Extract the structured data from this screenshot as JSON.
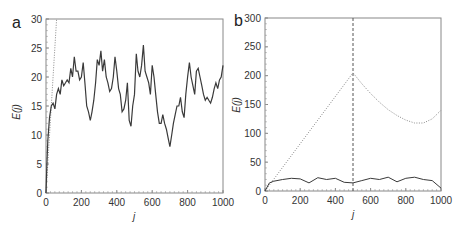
{
  "chart_data": [
    {
      "panel": "a",
      "type": "line",
      "xlabel": "j",
      "ylabel": "E(j)",
      "xlim": [
        0,
        1000
      ],
      "ylim": [
        0,
        30
      ],
      "xticks": [
        0,
        200,
        400,
        600,
        800,
        1000
      ],
      "yticks": [
        0,
        5,
        10,
        15,
        20,
        25,
        30
      ],
      "grid": false,
      "series": [
        {
          "name": "solid",
          "style": "solid",
          "x": [
            0,
            5,
            10,
            20,
            30,
            40,
            50,
            60,
            70,
            80,
            90,
            100,
            110,
            120,
            130,
            140,
            150,
            160,
            170,
            180,
            190,
            200,
            210,
            220,
            230,
            240,
            250,
            260,
            270,
            280,
            290,
            300,
            310,
            320,
            330,
            340,
            350,
            360,
            370,
            380,
            390,
            400,
            410,
            420,
            430,
            440,
            450,
            460,
            470,
            480,
            490,
            500,
            510,
            520,
            530,
            540,
            550,
            560,
            570,
            580,
            590,
            600,
            610,
            620,
            630,
            640,
            650,
            660,
            670,
            680,
            690,
            700,
            710,
            720,
            730,
            740,
            750,
            760,
            770,
            780,
            790,
            800,
            810,
            820,
            830,
            840,
            850,
            860,
            870,
            880,
            890,
            900,
            910,
            920,
            930,
            940,
            950,
            960,
            970,
            980,
            990,
            1000
          ],
          "values": [
            0,
            5,
            9,
            13,
            15,
            15.5,
            14.5,
            17,
            18,
            17,
            19.5,
            18.5,
            19,
            19.5,
            19,
            21.5,
            20,
            23.5,
            21,
            21,
            19.5,
            20,
            22.5,
            19,
            15,
            14,
            12.5,
            14,
            16,
            19,
            23,
            22,
            24.5,
            21,
            23,
            20,
            19,
            17.5,
            18,
            20,
            23.5,
            21,
            18,
            17,
            14,
            14.5,
            16,
            19,
            12.5,
            11.5,
            15,
            17,
            24,
            21,
            20,
            22,
            25.5,
            21,
            20,
            19,
            17,
            22,
            20,
            17,
            14,
            12,
            12,
            13.5,
            12,
            11,
            9.5,
            8,
            10,
            12,
            13.5,
            15,
            15,
            16.5,
            14,
            13,
            17,
            20,
            22.5,
            20,
            18.5,
            17,
            21,
            21.5,
            20,
            18.5,
            17,
            16,
            16.5,
            16,
            15.5,
            16.5,
            18,
            19,
            18,
            19.5,
            20,
            22
          ]
        },
        {
          "name": "dotted",
          "style": "dotted",
          "x": [
            0,
            60
          ],
          "values": [
            0,
            30
          ]
        }
      ]
    },
    {
      "panel": "b",
      "type": "line",
      "xlabel": "j",
      "ylabel": "E(j)",
      "xlim": [
        0,
        1000
      ],
      "ylim": [
        0,
        300
      ],
      "xticks": [
        0,
        200,
        400,
        600,
        800,
        1000
      ],
      "yticks": [
        0,
        50,
        100,
        150,
        200,
        250,
        300
      ],
      "grid": false,
      "annotations": [
        {
          "type": "vline",
          "style": "dashed",
          "x": 500
        }
      ],
      "series": [
        {
          "name": "solid",
          "style": "solid",
          "x": [
            0,
            25,
            50,
            100,
            150,
            200,
            250,
            300,
            350,
            400,
            450,
            500,
            550,
            600,
            650,
            700,
            750,
            800,
            850,
            900,
            950,
            1000
          ],
          "values": [
            0,
            14,
            17,
            20,
            22,
            21,
            14,
            23,
            20,
            22,
            15,
            14,
            18,
            22,
            20,
            24,
            16,
            22,
            24,
            20,
            18,
            5
          ]
        },
        {
          "name": "dotted",
          "style": "dotted",
          "x": [
            0,
            500,
            550,
            600,
            650,
            700,
            750,
            800,
            850,
            900,
            950,
            1000
          ],
          "values": [
            0,
            205,
            186,
            169,
            154,
            141,
            131,
            123,
            118,
            118,
            125,
            140
          ]
        }
      ]
    }
  ],
  "panels": {
    "a": {
      "letter": "a",
      "ylabel": "E(j)",
      "xlabel": "j",
      "yticks": [
        "0",
        "5",
        "10",
        "15",
        "20",
        "25",
        "30"
      ],
      "xticks": [
        "0",
        "200",
        "400",
        "600",
        "800",
        "1000"
      ]
    },
    "b": {
      "letter": "b",
      "ylabel": "E(j)",
      "xlabel": "j",
      "yticks": [
        "0",
        "50",
        "100",
        "150",
        "200",
        "250",
        "300"
      ],
      "xticks": [
        "0",
        "200",
        "400",
        "600",
        "800",
        "1000"
      ]
    }
  },
  "colors": {
    "line": "#3a3a3a",
    "dotted": "#8a8a8a",
    "axis": "#888888",
    "text": "#333333"
  }
}
